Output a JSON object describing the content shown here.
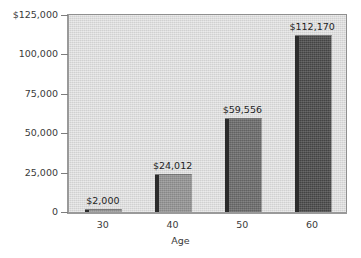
{
  "chart_data": {
    "type": "bar",
    "title": "",
    "xlabel": "Age",
    "ylabel": "",
    "categories": [
      "30",
      "40",
      "50",
      "60"
    ],
    "values": [
      2000,
      24012,
      59556,
      112170
    ],
    "value_labels": [
      "$2,000",
      "$24,012",
      "$59,556",
      "$112,170"
    ],
    "ylim": [
      0,
      125000
    ],
    "ytick_values": [
      125000,
      100000,
      75000,
      50000,
      25000,
      0
    ],
    "ytick_labels": [
      "$125,000",
      "100,000",
      "75,000",
      "50,000",
      "25,000",
      "0"
    ],
    "grid": false,
    "legend": null,
    "series": [
      {
        "name": "Savings by Age",
        "values": [
          2000,
          24012,
          59556,
          112170
        ]
      }
    ],
    "bar_colors": [
      "#9a9a9a",
      "#949494",
      "#6b6b6b",
      "#4a4a4a"
    ],
    "bar_edge_color": "#2b2b2b",
    "plot_background": "#d9d9d9",
    "frame_color": "#8f8f8f",
    "axis_color": "#9a9a9a",
    "text_color": "#3a3a3a",
    "page_background": "#ffffff"
  }
}
